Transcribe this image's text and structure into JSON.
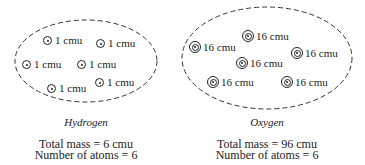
{
  "hydrogen": {
    "name": "Hydrogen",
    "atom_label": "1 cmu",
    "atoms": [
      {
        "x": 43,
        "y": 35,
        "label": "1 cmu"
      },
      {
        "x": 96,
        "y": 38,
        "label": "1 cmu"
      },
      {
        "x": 22,
        "y": 59,
        "label": "1 cmu"
      },
      {
        "x": 77,
        "y": 59,
        "label": "1 cmu"
      },
      {
        "x": 47,
        "y": 83,
        "label": "1 cmu"
      },
      {
        "x": 95,
        "y": 77,
        "label": "1 cmu"
      }
    ],
    "total_mass": "Total mass = 6 cmu",
    "num_atoms": "Number of atoms = 6"
  },
  "oxygen": {
    "name": "Oxygen",
    "atom_label": "16 cmu",
    "atoms": [
      {
        "x": 242,
        "y": 30,
        "label": "16 cmu"
      },
      {
        "x": 189,
        "y": 41,
        "label": "16 cmu"
      },
      {
        "x": 291,
        "y": 47,
        "label": "16 cmu"
      },
      {
        "x": 236,
        "y": 57,
        "label": "16 cmu"
      },
      {
        "x": 207,
        "y": 76,
        "label": "16 cmu"
      },
      {
        "x": 281,
        "y": 76,
        "label": "16 cmu"
      }
    ],
    "total_mass": "Total mass = 96 cmu",
    "num_atoms": "Number of atoms = 6"
  }
}
